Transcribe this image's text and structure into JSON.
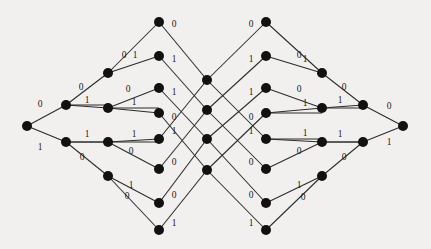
{
  "figure": {
    "name": "binary-trellis-diagram",
    "background_color": "#f2f0ee",
    "node_color": "#111111",
    "edge_color": "#2b2b2b",
    "label_color": "#1a1a1a",
    "node_radius": 5.0,
    "width": 431,
    "height": 249
  },
  "chart_data": {
    "type": "diagram",
    "title": "",
    "xlabel": "",
    "ylabel": "",
    "columns": [
      {
        "index": 0,
        "x": 27,
        "ys": [
          126
        ]
      },
      {
        "index": 1,
        "x": 66,
        "ys": [
          105,
          142
        ]
      },
      {
        "index": 2,
        "x": 108,
        "ys": [
          73,
          108,
          142,
          176
        ]
      },
      {
        "index": 3,
        "x": 159,
        "ys": [
          22,
          56,
          88,
          113,
          139,
          169,
          203,
          230
        ]
      },
      {
        "index": 4,
        "x": 207,
        "ys": [
          80,
          110,
          139,
          170
        ]
      },
      {
        "index": 5,
        "x": 266,
        "ys": [
          22,
          56,
          88,
          113,
          139,
          169,
          203,
          230
        ]
      },
      {
        "index": 6,
        "x": 322,
        "ys": [
          73,
          108,
          142,
          176
        ]
      },
      {
        "index": 7,
        "x": 363,
        "ys": [
          105,
          142
        ]
      },
      {
        "index": 8,
        "x": 403,
        "ys": [
          126
        ]
      }
    ],
    "nodes": [
      {
        "id": "n0_0",
        "col": 0,
        "row": 0,
        "x": 27,
        "y": 126
      },
      {
        "id": "n1_0",
        "col": 1,
        "row": 0,
        "x": 66,
        "y": 105
      },
      {
        "id": "n1_1",
        "col": 1,
        "row": 1,
        "x": 66,
        "y": 142
      },
      {
        "id": "n2_0",
        "col": 2,
        "row": 0,
        "x": 108,
        "y": 73
      },
      {
        "id": "n2_1",
        "col": 2,
        "row": 1,
        "x": 108,
        "y": 108
      },
      {
        "id": "n2_2",
        "col": 2,
        "row": 2,
        "x": 108,
        "y": 142
      },
      {
        "id": "n2_3",
        "col": 2,
        "row": 3,
        "x": 108,
        "y": 176
      },
      {
        "id": "n3_0",
        "col": 3,
        "row": 0,
        "x": 159,
        "y": 22
      },
      {
        "id": "n3_1",
        "col": 3,
        "row": 1,
        "x": 159,
        "y": 56
      },
      {
        "id": "n3_2",
        "col": 3,
        "row": 2,
        "x": 159,
        "y": 88
      },
      {
        "id": "n3_3",
        "col": 3,
        "row": 3,
        "x": 159,
        "y": 113
      },
      {
        "id": "n3_4",
        "col": 3,
        "row": 4,
        "x": 159,
        "y": 139
      },
      {
        "id": "n3_5",
        "col": 3,
        "row": 5,
        "x": 159,
        "y": 169
      },
      {
        "id": "n3_6",
        "col": 3,
        "row": 6,
        "x": 159,
        "y": 203
      },
      {
        "id": "n3_7",
        "col": 3,
        "row": 7,
        "x": 159,
        "y": 230
      },
      {
        "id": "n4_0",
        "col": 4,
        "row": 0,
        "x": 207,
        "y": 80
      },
      {
        "id": "n4_1",
        "col": 4,
        "row": 1,
        "x": 207,
        "y": 110
      },
      {
        "id": "n4_2",
        "col": 4,
        "row": 2,
        "x": 207,
        "y": 139
      },
      {
        "id": "n4_3",
        "col": 4,
        "row": 3,
        "x": 207,
        "y": 170
      },
      {
        "id": "n5_0",
        "col": 5,
        "row": 0,
        "x": 266,
        "y": 22
      },
      {
        "id": "n5_1",
        "col": 5,
        "row": 1,
        "x": 266,
        "y": 56
      },
      {
        "id": "n5_2",
        "col": 5,
        "row": 2,
        "x": 266,
        "y": 88
      },
      {
        "id": "n5_3",
        "col": 5,
        "row": 3,
        "x": 266,
        "y": 113
      },
      {
        "id": "n5_4",
        "col": 5,
        "row": 4,
        "x": 266,
        "y": 139
      },
      {
        "id": "n5_5",
        "col": 5,
        "row": 5,
        "x": 266,
        "y": 169
      },
      {
        "id": "n5_6",
        "col": 5,
        "row": 6,
        "x": 266,
        "y": 203
      },
      {
        "id": "n5_7",
        "col": 5,
        "row": 7,
        "x": 266,
        "y": 230
      },
      {
        "id": "n6_0",
        "col": 6,
        "row": 0,
        "x": 322,
        "y": 73
      },
      {
        "id": "n6_1",
        "col": 6,
        "row": 1,
        "x": 322,
        "y": 108
      },
      {
        "id": "n6_2",
        "col": 6,
        "row": 2,
        "x": 322,
        "y": 142
      },
      {
        "id": "n6_3",
        "col": 6,
        "row": 3,
        "x": 322,
        "y": 176
      },
      {
        "id": "n7_0",
        "col": 7,
        "row": 0,
        "x": 363,
        "y": 105
      },
      {
        "id": "n7_1",
        "col": 7,
        "row": 1,
        "x": 363,
        "y": 142
      },
      {
        "id": "n8_0",
        "col": 8,
        "row": 0,
        "x": 403,
        "y": 126
      }
    ],
    "edges": [
      {
        "from": "n0_0",
        "to": "n1_0",
        "label": "0",
        "lx": 40,
        "ly": 105
      },
      {
        "from": "n0_0",
        "to": "n1_1",
        "label": "1",
        "lx": 40,
        "ly": 148
      },
      {
        "from": "n1_0",
        "to": "n2_0",
        "label": "0",
        "lx": 81,
        "ly": 88
      },
      {
        "from": "n1_0",
        "to": "n2_1",
        "label": "1",
        "lx": 87,
        "ly": 101
      },
      {
        "from": "n1_1",
        "to": "n2_2",
        "label": "1",
        "lx": 87,
        "ly": 135
      },
      {
        "from": "n1_1",
        "to": "n2_3",
        "label": "0",
        "lx": 82,
        "ly": 158
      },
      {
        "from": "n2_0",
        "to": "n3_0",
        "label": "0",
        "lx": 124,
        "ly": 56
      },
      {
        "from": "n2_0",
        "to": "n3_1",
        "label": "1",
        "lx": 135,
        "ly": 56
      },
      {
        "from": "n2_1",
        "to": "n3_2",
        "label": "0",
        "lx": 128,
        "ly": 90
      },
      {
        "from": "n2_1",
        "to": "n3_3",
        "label": "1",
        "lx": 134,
        "ly": 103
      },
      {
        "from": "n2_2",
        "to": "n3_4",
        "label": "1",
        "lx": 134,
        "ly": 135
      },
      {
        "from": "n2_2",
        "to": "n3_5",
        "label": "0",
        "lx": 131,
        "ly": 152
      },
      {
        "from": "n2_3",
        "to": "n3_6",
        "label": "1",
        "lx": 131,
        "ly": 186
      },
      {
        "from": "n2_3",
        "to": "n3_7",
        "label": "0",
        "lx": 127,
        "ly": 197
      },
      {
        "from": "n3_0",
        "to": "n4_0",
        "label": "0",
        "lx": 174,
        "ly": 25
      },
      {
        "from": "n3_1",
        "to": "n4_1",
        "label": "1",
        "lx": 174,
        "ly": 60
      },
      {
        "from": "n3_2",
        "to": "n4_2",
        "label": "1",
        "lx": 174,
        "ly": 93
      },
      {
        "from": "n3_3",
        "to": "n4_3",
        "label": "0",
        "lx": 174,
        "ly": 118
      },
      {
        "from": "n3_4",
        "to": "n4_0",
        "label": "1",
        "lx": 174,
        "ly": 132
      },
      {
        "from": "n3_5",
        "to": "n4_1",
        "label": "0",
        "lx": 174,
        "ly": 163
      },
      {
        "from": "n3_6",
        "to": "n4_2",
        "label": "0",
        "lx": 174,
        "ly": 196
      },
      {
        "from": "n3_7",
        "to": "n4_3",
        "label": "1",
        "lx": 174,
        "ly": 224
      },
      {
        "from": "n4_0",
        "to": "n5_0",
        "label": "0",
        "lx": 251,
        "ly": 25
      },
      {
        "from": "n4_1",
        "to": "n5_1",
        "label": "1",
        "lx": 251,
        "ly": 60
      },
      {
        "from": "n4_2",
        "to": "n5_2",
        "label": "1",
        "lx": 251,
        "ly": 93
      },
      {
        "from": "n4_3",
        "to": "n5_3",
        "label": "0",
        "lx": 251,
        "ly": 118
      },
      {
        "from": "n4_0",
        "to": "n5_4",
        "label": "1",
        "lx": 251,
        "ly": 132
      },
      {
        "from": "n4_1",
        "to": "n5_5",
        "label": "0",
        "lx": 251,
        "ly": 163
      },
      {
        "from": "n4_2",
        "to": "n5_6",
        "label": "0",
        "lx": 251,
        "ly": 196
      },
      {
        "from": "n4_3",
        "to": "n5_7",
        "label": "1",
        "lx": 251,
        "ly": 224
      },
      {
        "from": "n5_0",
        "to": "n6_0",
        "label": "0",
        "lx": 299,
        "ly": 56
      },
      {
        "from": "n5_1",
        "to": "n6_0",
        "label": "1",
        "lx": 305,
        "ly": 60
      },
      {
        "from": "n5_2",
        "to": "n6_1",
        "label": "0",
        "lx": 299,
        "ly": 90
      },
      {
        "from": "n5_3",
        "to": "n6_1",
        "label": "1",
        "lx": 305,
        "ly": 104
      },
      {
        "from": "n5_4",
        "to": "n6_2",
        "label": "1",
        "lx": 305,
        "ly": 134
      },
      {
        "from": "n5_5",
        "to": "n6_2",
        "label": "0",
        "lx": 299,
        "ly": 152
      },
      {
        "from": "n5_6",
        "to": "n6_3",
        "label": "1",
        "lx": 299,
        "ly": 186
      },
      {
        "from": "n5_7",
        "to": "n6_3",
        "label": "0",
        "lx": 303,
        "ly": 198
      },
      {
        "from": "n6_0",
        "to": "n7_0",
        "label": "0",
        "lx": 344,
        "ly": 88
      },
      {
        "from": "n6_1",
        "to": "n7_0",
        "label": "1",
        "lx": 340,
        "ly": 101
      },
      {
        "from": "n6_2",
        "to": "n7_1",
        "label": "1",
        "lx": 340,
        "ly": 135
      },
      {
        "from": "n6_3",
        "to": "n7_1",
        "label": "0",
        "lx": 344,
        "ly": 158
      },
      {
        "from": "n7_0",
        "to": "n8_0",
        "label": "0",
        "lx": 389,
        "ly": 107
      },
      {
        "from": "n7_1",
        "to": "n8_0",
        "label": "1",
        "lx": 389,
        "ly": 143
      }
    ],
    "horizontal_edges": [
      {
        "from": "n1_0",
        "to": "n2_1",
        "label": "1"
      },
      {
        "from": "n1_1",
        "to": "n2_2",
        "label": "1"
      },
      {
        "from": "n2_1",
        "to": "n3_3",
        "label": "1"
      },
      {
        "from": "n2_2",
        "to": "n3_4",
        "label": "1"
      },
      {
        "from": "n5_3",
        "to": "n6_1",
        "label": "1"
      },
      {
        "from": "n5_4",
        "to": "n6_2",
        "label": "1"
      },
      {
        "from": "n6_1",
        "to": "n7_0",
        "label": "1"
      },
      {
        "from": "n6_2",
        "to": "n7_1",
        "label": "1"
      }
    ],
    "legend": [],
    "annotations": [],
    "bit_alphabet": [
      "0",
      "1"
    ],
    "node_count": 34,
    "edge_count": 42
  }
}
